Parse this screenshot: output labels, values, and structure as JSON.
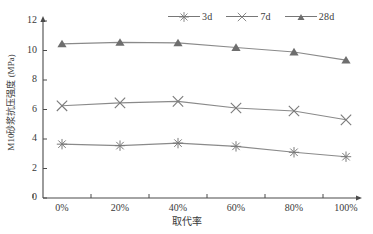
{
  "chart_data": {
    "type": "line",
    "title": "",
    "xlabel": "取代率",
    "ylabel": "M10砂浆抗压强度 (MPa)",
    "categories": [
      "0%",
      "20%",
      "40%",
      "60%",
      "80%",
      "100%"
    ],
    "x_values": [
      0,
      20,
      40,
      60,
      80,
      100
    ],
    "ylim": [
      0,
      12
    ],
    "yticks": [
      0,
      2,
      4,
      6,
      8,
      10,
      12
    ],
    "grid": false,
    "legend_position": "top-right",
    "series": [
      {
        "name": "3d",
        "marker": "asterisk",
        "color": "#7a7a7a",
        "values": [
          3.65,
          3.55,
          3.72,
          3.5,
          3.1,
          2.8
        ]
      },
      {
        "name": "7d",
        "marker": "x-cross",
        "color": "#7a7a7a",
        "values": [
          6.25,
          6.45,
          6.55,
          6.1,
          5.9,
          5.3
        ]
      },
      {
        "name": "28d",
        "marker": "triangle",
        "color": "#6e6e6e",
        "values": [
          10.45,
          10.55,
          10.52,
          10.2,
          9.9,
          9.35
        ]
      }
    ]
  },
  "axes": {
    "y_tick_labels": [
      "12",
      "10",
      "8",
      "6",
      "4",
      "2",
      "0"
    ],
    "x_tick_labels": [
      "0%",
      "20%",
      "40%",
      "60%",
      "80%",
      "100%"
    ],
    "y_axis_title": "M10砂浆抗压强度 (MPa)",
    "x_axis_title": "取代率"
  },
  "legend": {
    "items": [
      {
        "label": "3d",
        "marker": "asterisk-icon"
      },
      {
        "label": "7d",
        "marker": "x-cross-icon"
      },
      {
        "label": "28d",
        "marker": "triangle-icon"
      }
    ]
  },
  "colors": {
    "axis": "#4a4a4a",
    "line": "#8a8a8a",
    "marker_28d": "#6e6e6e",
    "marker_7d": "#7c7c7c",
    "marker_3d": "#7c7c7c",
    "background": "#ffffff",
    "text": "#3a3a3a"
  }
}
